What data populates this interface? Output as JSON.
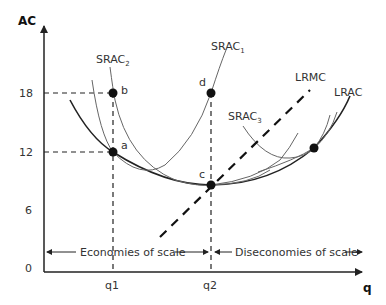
{
  "axes": {
    "y_label": "AC",
    "x_label": "q",
    "y_ticks": [
      "18",
      "12",
      "6",
      "0"
    ],
    "x_ticks": [
      "q1",
      "q2"
    ]
  },
  "curves": {
    "srac1": "SRAC",
    "srac1_sub": "1",
    "srac2": "SRAC",
    "srac2_sub": "2",
    "srac3": "SRAC",
    "srac3_sub": "3",
    "lrmc": "LRMC",
    "lrac": "LRAC"
  },
  "points": {
    "a": "a",
    "b": "b",
    "c": "c",
    "d": "d"
  },
  "regions": {
    "economies": "Economies of scale",
    "diseconomies": "Diseconomies of scale"
  },
  "colors": {
    "line": "#222222",
    "thin_curve": "#666666",
    "background": "#ffffff"
  }
}
